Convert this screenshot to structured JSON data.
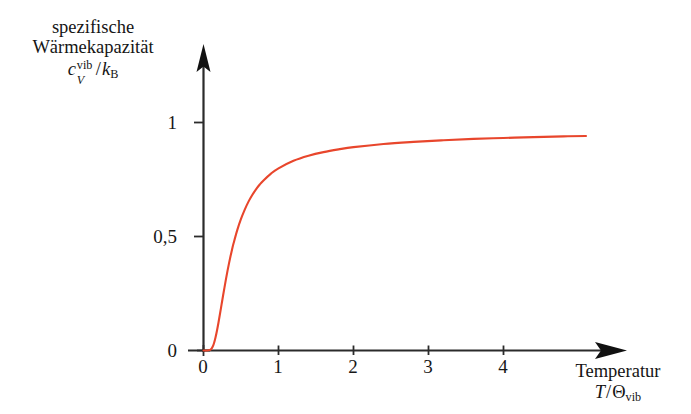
{
  "figure": {
    "background_color": "#ffffff",
    "axis_color": "#2b2b2b",
    "curve_color": "#e8462c"
  },
  "y_axis_title": {
    "line1": "spezifische",
    "line2": "Wärmekapazität",
    "math_symbol": "c",
    "math_superscript": "vib",
    "math_subscript": "V",
    "math_slash": "/",
    "math_denominator": "k",
    "math_denominator_sub": "B",
    "plain": "spezifische Wärmekapazität c_V^vib / k_B"
  },
  "x_axis_title": {
    "line1": "Temperatur",
    "math_symbol": "T",
    "math_slash": "/",
    "math_denominator": "Θ",
    "math_denominator_sub": "vib",
    "plain": "Temperatur T/Θ_vib"
  },
  "ticks": {
    "x_labels": [
      "0",
      "1",
      "2",
      "3",
      "4"
    ],
    "y_labels": [
      "0",
      "0,5",
      "1"
    ]
  },
  "chart_data": {
    "type": "line",
    "title": "",
    "subtitle": "",
    "xlabel": "Temperatur T/Θ_vib",
    "ylabel": "spezifische Wärmekapazität c_V^vib / k_B",
    "xlim": [
      0,
      5.6
    ],
    "ylim": [
      0,
      1.12
    ],
    "xticks": [
      0,
      1,
      2,
      3,
      4
    ],
    "xticklabels": [
      "0",
      "1",
      "2",
      "3",
      "4"
    ],
    "yticks": [
      0,
      0.5,
      1
    ],
    "yticklabels": [
      "0",
      "0,5",
      "1"
    ],
    "grid": false,
    "legend": null,
    "legend_position": "none",
    "annotations": [],
    "series": [
      {
        "name": "Einstein vibrational heat capacity",
        "color": "#e8462c",
        "linewidth": 2,
        "formula": "(1/x)^2 * exp(1/x) / (exp(1/x) - 1)^2",
        "x": [
          0.0,
          0.05,
          0.08,
          0.1,
          0.12,
          0.14,
          0.16,
          0.18,
          0.2,
          0.22,
          0.24,
          0.26,
          0.28,
          0.3,
          0.32,
          0.34,
          0.36,
          0.38,
          0.4,
          0.45,
          0.5,
          0.55,
          0.6,
          0.65,
          0.7,
          0.75,
          0.8,
          0.9,
          1.0,
          1.2,
          1.4,
          1.6,
          1.8,
          2.0,
          2.4,
          2.8,
          3.2,
          3.6,
          4.0,
          4.4,
          4.8,
          5.1
        ],
        "y": [
          0.0,
          0.0,
          0.002,
          0.005,
          0.015,
          0.032,
          0.057,
          0.088,
          0.123,
          0.161,
          0.2,
          0.239,
          0.277,
          0.314,
          0.349,
          0.382,
          0.413,
          0.442,
          0.469,
          0.528,
          0.577,
          0.618,
          0.653,
          0.682,
          0.707,
          0.728,
          0.746,
          0.776,
          0.799,
          0.832,
          0.854,
          0.87,
          0.882,
          0.892,
          0.906,
          0.915,
          0.922,
          0.928,
          0.932,
          0.936,
          0.939,
          0.941
        ]
      }
    ],
    "asymptote": {
      "value": 1,
      "description": "Dulong-Petit / classical limit c_V/k_B -> 1"
    }
  }
}
